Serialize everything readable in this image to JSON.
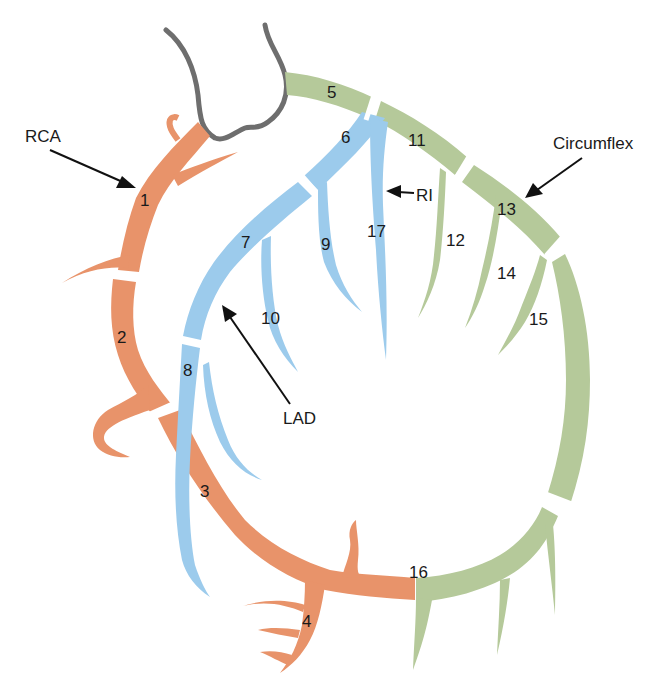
{
  "colors": {
    "rca": "#e8936a",
    "lad": "#9ccbec",
    "circumflex": "#b5c99a",
    "aorta_outline": "#6e6e6e",
    "text": "#1a1a1a"
  },
  "vessels": {
    "rca": "RCA",
    "lad": "LAD",
    "circumflex": "Circumflex",
    "ri": "RI"
  },
  "segments": {
    "s1": "1",
    "s2": "2",
    "s3": "3",
    "s4": "4",
    "s5": "5",
    "s6": "6",
    "s7": "7",
    "s8": "8",
    "s9": "9",
    "s10": "10",
    "s11": "11",
    "s12": "12",
    "s13": "13",
    "s14": "14",
    "s15": "15",
    "s16": "16",
    "s17": "17"
  },
  "segment_groups": {
    "rca": [
      "1",
      "2",
      "3",
      "4"
    ],
    "left_main": [
      "5"
    ],
    "lad": [
      "6",
      "7",
      "8",
      "9",
      "10",
      "17"
    ],
    "circumflex": [
      "11",
      "12",
      "13",
      "14",
      "15",
      "16"
    ]
  }
}
